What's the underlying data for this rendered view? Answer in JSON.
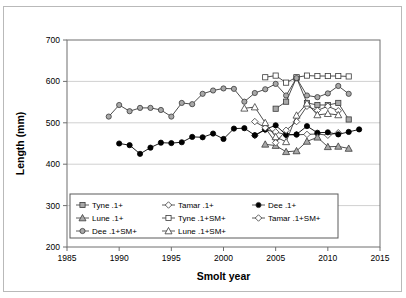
{
  "figure": {
    "has_outer_border": true,
    "background": "#ffffff"
  },
  "chart_data": {
    "type": "line",
    "title": "",
    "xlabel": "Smolt year",
    "ylabel": "Length (mm)",
    "xlim": [
      1985,
      2015
    ],
    "ylim": [
      200,
      700
    ],
    "xticks": [
      1985,
      1990,
      1995,
      2000,
      2005,
      2010,
      2015
    ],
    "yticks": [
      200,
      300,
      400,
      500,
      600,
      700
    ],
    "grid": "horizontal",
    "legend_position": "inside-bottom-left",
    "series": [
      {
        "name": "Tyne .1+",
        "marker": "square",
        "fill": "#a8a8a8",
        "stroke": "#3a3a3a",
        "x": [
          2005,
          2006,
          2007,
          2008,
          2009,
          2010,
          2011,
          2012
        ],
        "y": [
          534,
          551,
          609,
          548,
          543,
          543,
          548,
          508
        ]
      },
      {
        "name": "Tamar .1+",
        "marker": "diamond",
        "fill": "#ffffff",
        "stroke": "#3a3a3a",
        "x": [
          2003,
          2004,
          2005,
          2006,
          2007,
          2008,
          2009,
          2010,
          2011
        ],
        "y": [
          469,
          483,
          478,
          471,
          471,
          472,
          473,
          470,
          476
        ]
      },
      {
        "name": "Dee .1+",
        "marker": "circle",
        "fill": "#000000",
        "stroke": "#000000",
        "x": [
          1990,
          1991,
          1992,
          1993,
          1994,
          1995,
          1996,
          1997,
          1998,
          1999,
          2000,
          2001,
          2002,
          2003,
          2004,
          2005,
          2006,
          2007,
          2008,
          2009,
          2010,
          2011,
          2012,
          2013
        ],
        "y": [
          450,
          446,
          425,
          440,
          452,
          451,
          453,
          466,
          465,
          474,
          461,
          486,
          487,
          470,
          484,
          494,
          471,
          472,
          492,
          476,
          477,
          472,
          478,
          484
        ]
      },
      {
        "name": "Lune .1+",
        "marker": "triangle",
        "fill": "#a8a8a8",
        "stroke": "#3a3a3a",
        "x": [
          2004,
          2005,
          2006,
          2007,
          2008,
          2009,
          2010,
          2011,
          2012
        ],
        "y": [
          448,
          445,
          430,
          432,
          455,
          465,
          442,
          443,
          438
        ]
      },
      {
        "name": "Tyne .1+SM+",
        "marker": "square",
        "fill": "#ffffff",
        "stroke": "#3a3a3a",
        "x": [
          2004,
          2005,
          2006,
          2007,
          2008,
          2009,
          2010,
          2011,
          2012
        ],
        "y": [
          610,
          614,
          597,
          610,
          614,
          613,
          613,
          613,
          612
        ]
      },
      {
        "name": "Tamar .1+SM+",
        "marker": "diamond",
        "fill": "#ffffff",
        "stroke": "#3a3a3a",
        "x": [
          2003,
          2004,
          2005,
          2006,
          2007,
          2008,
          2009,
          2010,
          2011
        ],
        "y": [
          503,
          488,
          452,
          482,
          503,
          540,
          530,
          540,
          529
        ]
      },
      {
        "name": "Dee .1+SM+",
        "marker": "circle",
        "fill": "#a8a8a8",
        "stroke": "#3a3a3a",
        "x": [
          1989,
          1990,
          1991,
          1992,
          1993,
          1994,
          1995,
          1996,
          1997,
          1998,
          1999,
          2000,
          2001,
          2002,
          2003,
          2004,
          2005,
          2006,
          2007,
          2008,
          2009,
          2010,
          2011,
          2012
        ],
        "y": [
          515,
          543,
          528,
          536,
          536,
          531,
          515,
          548,
          545,
          570,
          578,
          583,
          582,
          551,
          572,
          581,
          594,
          566,
          608,
          566,
          562,
          571,
          589,
          570
        ]
      },
      {
        "name": "Lune .1+SM+",
        "marker": "triangle",
        "fill": "#ffffff",
        "stroke": "#3a3a3a",
        "x": [
          2002,
          2003,
          2004,
          2005,
          2006,
          2007,
          2008,
          2009,
          2010,
          2011
        ],
        "y": [
          535,
          538,
          500,
          466,
          454,
          518,
          547,
          519,
          522,
          519
        ]
      }
    ]
  },
  "legend": {
    "entries": [
      {
        "label": "Tyne .1+",
        "marker": "square",
        "fill": "#a8a8a8"
      },
      {
        "label": "Tamar .1+",
        "marker": "diamond",
        "fill": "#ffffff"
      },
      {
        "label": "Dee .1+",
        "marker": "circle",
        "fill": "#000000"
      },
      {
        "label": "Lune .1+",
        "marker": "triangle",
        "fill": "#a8a8a8"
      },
      {
        "label": "Tyne .1+SM+",
        "marker": "square",
        "fill": "#ffffff"
      },
      {
        "label": "Tamar .1+SM+",
        "marker": "diamond",
        "fill": "#ffffff"
      },
      {
        "label": "Dee .1+SM+",
        "marker": "circle",
        "fill": "#a8a8a8"
      },
      {
        "label": "Lune .1+SM+",
        "marker": "triangle",
        "fill": "#ffffff"
      }
    ]
  },
  "colors": {
    "grid": "#d0d0d0",
    "axis": "#6f6f6f",
    "marker_grey": "#a8a8a8",
    "marker_black": "#000000",
    "marker_white": "#ffffff",
    "line": "#4a4a4a"
  }
}
